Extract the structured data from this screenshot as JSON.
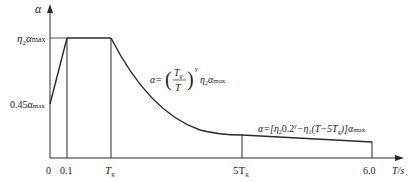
{
  "diagram": {
    "type": "seismic-influence-coefficient-curve",
    "colors": {
      "line": "#2a2a2a",
      "background": "#ffffff"
    },
    "axes": {
      "y_label": "α",
      "x_label": "T/s",
      "y_ticks": [
        {
          "label_main": "η",
          "label_sub": "2",
          "label_tail": "α",
          "label_tail_sub": "max",
          "meaning": "η2·αmax"
        },
        {
          "label_main": "0.45α",
          "label_sub": "max",
          "meaning": "0.45αmax"
        }
      ],
      "x_ticks": [
        {
          "label": "0"
        },
        {
          "label": "0.1"
        },
        {
          "label_main": "T",
          "label_sub": "g"
        },
        {
          "label_main": "5T",
          "label_sub": "g"
        },
        {
          "label": "6.0"
        }
      ]
    },
    "segments": [
      {
        "name": "linear-rise",
        "from": "0, 0.45αmax",
        "to": "0.1, η2αmax"
      },
      {
        "name": "plateau",
        "from": "0.1",
        "to": "Tg",
        "value": "η2αmax"
      },
      {
        "name": "curve-descent",
        "from": "Tg",
        "to": "5Tg"
      },
      {
        "name": "linear-descent",
        "from": "5Tg",
        "to": "6.0"
      }
    ],
    "formulas": {
      "curve": {
        "lhs": "α=",
        "frac_num": "T",
        "frac_num_sub": "g",
        "frac_den": "T",
        "exp": "γ",
        "tail": "η",
        "tail_sub": "2",
        "tail2": "α",
        "tail2_sub": "max"
      },
      "line": {
        "text_a": "α=[η",
        "sub_a": "2",
        "text_b": "0.2",
        "sup_b": "γ",
        "text_c": "−η",
        "sub_c": "1",
        "text_d": "(T−5T",
        "sub_d": "g",
        "text_e": ")]α",
        "sub_e": "max"
      }
    }
  }
}
